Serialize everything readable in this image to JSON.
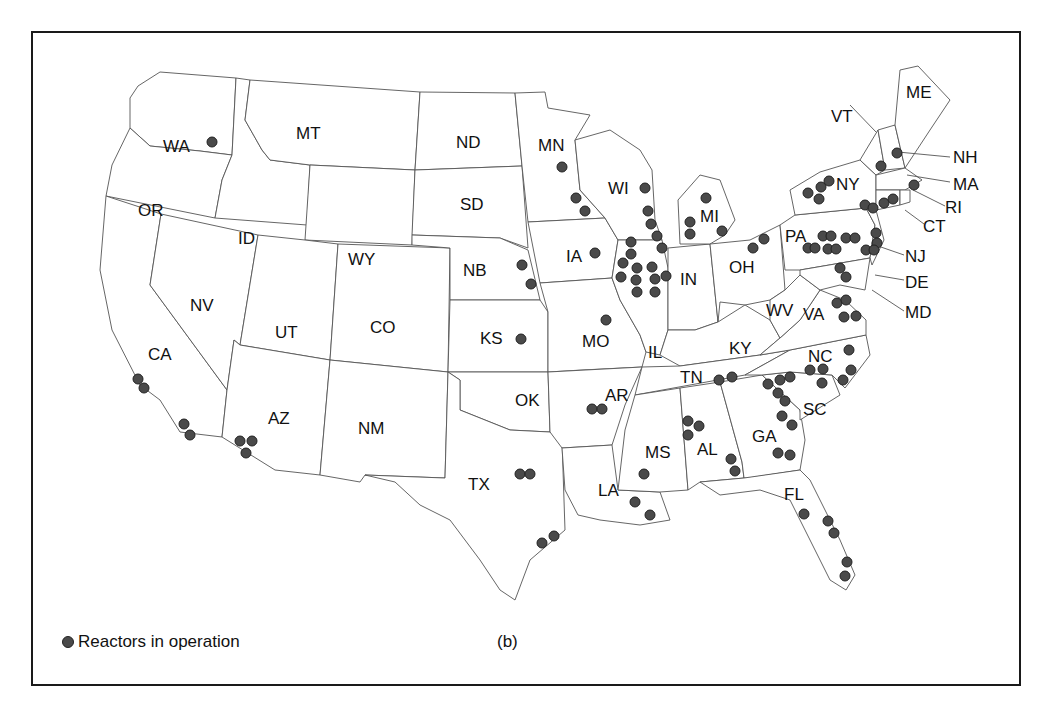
{
  "figure": {
    "caption": "(b)",
    "legend": {
      "label": "Reactors in operation",
      "marker_color": "#4a4a4a"
    },
    "frame_color": "#1a1a1a",
    "state_stroke": "#555555"
  },
  "states": [
    {
      "abbr": "WA",
      "x": 163,
      "y": 152
    },
    {
      "abbr": "OR",
      "x": 138,
      "y": 216
    },
    {
      "abbr": "MT",
      "x": 296,
      "y": 139
    },
    {
      "abbr": "ID",
      "x": 238,
      "y": 244
    },
    {
      "abbr": "WY",
      "x": 348,
      "y": 265
    },
    {
      "abbr": "ND",
      "x": 456,
      "y": 148
    },
    {
      "abbr": "SD",
      "x": 460,
      "y": 210
    },
    {
      "abbr": "NB",
      "x": 463,
      "y": 276
    },
    {
      "abbr": "MN",
      "x": 538,
      "y": 151
    },
    {
      "abbr": "WI",
      "x": 608,
      "y": 194
    },
    {
      "abbr": "MI",
      "x": 700,
      "y": 222
    },
    {
      "abbr": "IA",
      "x": 566,
      "y": 262
    },
    {
      "abbr": "IN",
      "x": 680,
      "y": 285
    },
    {
      "abbr": "OH",
      "x": 729,
      "y": 273
    },
    {
      "abbr": "PA",
      "x": 785,
      "y": 242
    },
    {
      "abbr": "NY",
      "x": 836,
      "y": 190
    },
    {
      "abbr": "VT",
      "x": 831,
      "y": 122
    },
    {
      "abbr": "ME",
      "x": 906,
      "y": 98
    },
    {
      "abbr": "NV",
      "x": 190,
      "y": 311
    },
    {
      "abbr": "UT",
      "x": 275,
      "y": 338
    },
    {
      "abbr": "CO",
      "x": 370,
      "y": 333
    },
    {
      "abbr": "KS",
      "x": 480,
      "y": 344
    },
    {
      "abbr": "MO",
      "x": 582,
      "y": 347
    },
    {
      "abbr": "IL",
      "x": 648,
      "y": 358
    },
    {
      "abbr": "KY",
      "x": 729,
      "y": 354
    },
    {
      "abbr": "WV",
      "x": 766,
      "y": 316
    },
    {
      "abbr": "VA",
      "x": 803,
      "y": 320
    },
    {
      "abbr": "CA",
      "x": 148,
      "y": 360
    },
    {
      "abbr": "AZ",
      "x": 268,
      "y": 424
    },
    {
      "abbr": "NM",
      "x": 358,
      "y": 434
    },
    {
      "abbr": "OK",
      "x": 515,
      "y": 406
    },
    {
      "abbr": "AR",
      "x": 605,
      "y": 401
    },
    {
      "abbr": "TN",
      "x": 680,
      "y": 383
    },
    {
      "abbr": "NC",
      "x": 808,
      "y": 362
    },
    {
      "abbr": "SC",
      "x": 803,
      "y": 415
    },
    {
      "abbr": "GA",
      "x": 752,
      "y": 442
    },
    {
      "abbr": "AL",
      "x": 697,
      "y": 455
    },
    {
      "abbr": "MS",
      "x": 645,
      "y": 458
    },
    {
      "abbr": "TX",
      "x": 468,
      "y": 490
    },
    {
      "abbr": "LA",
      "x": 598,
      "y": 496
    },
    {
      "abbr": "FL",
      "x": 784,
      "y": 500
    }
  ],
  "leader_labels": [
    {
      "abbr": "NH",
      "x": 953,
      "y": 163,
      "line": [
        898,
        152,
        950,
        157
      ]
    },
    {
      "abbr": "MA",
      "x": 953,
      "y": 190,
      "line": [
        907,
        175,
        950,
        182
      ]
    },
    {
      "abbr": "RI",
      "x": 945,
      "y": 213,
      "line": [
        913,
        190,
        945,
        206
      ]
    },
    {
      "abbr": "CT",
      "x": 923,
      "y": 232,
      "line": [
        905,
        210,
        924,
        224
      ]
    },
    {
      "abbr": "NJ",
      "x": 905,
      "y": 262,
      "line": [
        878,
        246,
        904,
        255
      ]
    },
    {
      "abbr": "DE",
      "x": 905,
      "y": 288,
      "line": [
        875,
        275,
        904,
        280
      ]
    },
    {
      "abbr": "MD",
      "x": 905,
      "y": 318,
      "line": [
        872,
        290,
        904,
        311
      ]
    },
    {
      "abbr": "VT",
      "x": 0,
      "y": 0,
      "line": [
        850,
        105,
        876,
        132
      ]
    }
  ],
  "chart_data": {
    "type": "scatter",
    "legend": [
      "Reactors in operation"
    ],
    "points": [
      {
        "state": "WA",
        "x": 212,
        "y": 142
      },
      {
        "state": "CA",
        "x": 138,
        "y": 379
      },
      {
        "state": "CA",
        "x": 144,
        "y": 388
      },
      {
        "state": "CA",
        "x": 184,
        "y": 424
      },
      {
        "state": "CA",
        "x": 190,
        "y": 435
      },
      {
        "state": "AZ",
        "x": 240,
        "y": 441
      },
      {
        "state": "AZ",
        "x": 252,
        "y": 441
      },
      {
        "state": "AZ",
        "x": 246,
        "y": 453
      },
      {
        "state": "NB",
        "x": 522,
        "y": 265
      },
      {
        "state": "NB",
        "x": 531,
        "y": 284
      },
      {
        "state": "KS",
        "x": 521,
        "y": 339
      },
      {
        "state": "TX",
        "x": 520,
        "y": 474
      },
      {
        "state": "TX",
        "x": 530,
        "y": 474
      },
      {
        "state": "TX",
        "x": 542,
        "y": 543
      },
      {
        "state": "TX",
        "x": 554,
        "y": 536
      },
      {
        "state": "MN",
        "x": 562,
        "y": 167
      },
      {
        "state": "MN",
        "x": 576,
        "y": 198
      },
      {
        "state": "MN",
        "x": 585,
        "y": 211
      },
      {
        "state": "IA",
        "x": 595,
        "y": 253
      },
      {
        "state": "MO",
        "x": 606,
        "y": 320
      },
      {
        "state": "AR",
        "x": 592,
        "y": 409
      },
      {
        "state": "AR",
        "x": 602,
        "y": 409
      },
      {
        "state": "WI",
        "x": 645,
        "y": 188
      },
      {
        "state": "WI",
        "x": 648,
        "y": 211
      },
      {
        "state": "WI",
        "x": 651,
        "y": 224
      },
      {
        "state": "IL",
        "x": 657,
        "y": 236
      },
      {
        "state": "IL",
        "x": 662,
        "y": 248
      },
      {
        "state": "IL",
        "x": 631,
        "y": 242
      },
      {
        "state": "IL",
        "x": 631,
        "y": 254
      },
      {
        "state": "IL",
        "x": 623,
        "y": 263
      },
      {
        "state": "IL",
        "x": 621,
        "y": 277
      },
      {
        "state": "IL",
        "x": 637,
        "y": 268
      },
      {
        "state": "IL",
        "x": 636,
        "y": 280
      },
      {
        "state": "IL",
        "x": 637,
        "y": 292
      },
      {
        "state": "IL",
        "x": 652,
        "y": 267
      },
      {
        "state": "IL",
        "x": 655,
        "y": 279
      },
      {
        "state": "IL",
        "x": 666,
        "y": 276
      },
      {
        "state": "IL",
        "x": 655,
        "y": 292
      },
      {
        "state": "MI",
        "x": 706,
        "y": 198
      },
      {
        "state": "MI",
        "x": 690,
        "y": 222
      },
      {
        "state": "MI",
        "x": 690,
        "y": 234
      },
      {
        "state": "MI",
        "x": 722,
        "y": 231
      },
      {
        "state": "OH",
        "x": 753,
        "y": 248
      },
      {
        "state": "OH",
        "x": 764,
        "y": 239
      },
      {
        "state": "LA",
        "x": 635,
        "y": 502
      },
      {
        "state": "LA",
        "x": 650,
        "y": 515
      },
      {
        "state": "MS",
        "x": 644,
        "y": 474
      },
      {
        "state": "AL",
        "x": 688,
        "y": 421
      },
      {
        "state": "AL",
        "x": 699,
        "y": 426
      },
      {
        "state": "AL",
        "x": 688,
        "y": 435
      },
      {
        "state": "AL",
        "x": 731,
        "y": 459
      },
      {
        "state": "AL",
        "x": 735,
        "y": 471
      },
      {
        "state": "TN",
        "x": 719,
        "y": 380
      },
      {
        "state": "TN",
        "x": 732,
        "y": 377
      },
      {
        "state": "GA",
        "x": 778,
        "y": 453
      },
      {
        "state": "GA",
        "x": 790,
        "y": 455
      },
      {
        "state": "GA",
        "x": 782,
        "y": 416
      },
      {
        "state": "GA",
        "x": 792,
        "y": 425
      },
      {
        "state": "SC",
        "x": 768,
        "y": 384
      },
      {
        "state": "SC",
        "x": 778,
        "y": 393
      },
      {
        "state": "SC",
        "x": 785,
        "y": 401
      },
      {
        "state": "SC",
        "x": 780,
        "y": 380
      },
      {
        "state": "SC",
        "x": 790,
        "y": 377
      },
      {
        "state": "SC",
        "x": 822,
        "y": 383
      },
      {
        "state": "NC",
        "x": 810,
        "y": 370
      },
      {
        "state": "NC",
        "x": 823,
        "y": 369
      },
      {
        "state": "NC",
        "x": 849,
        "y": 350
      },
      {
        "state": "NC",
        "x": 851,
        "y": 370
      },
      {
        "state": "NC",
        "x": 843,
        "y": 380
      },
      {
        "state": "FL",
        "x": 804,
        "y": 514
      },
      {
        "state": "FL",
        "x": 828,
        "y": 521
      },
      {
        "state": "FL",
        "x": 834,
        "y": 533
      },
      {
        "state": "FL",
        "x": 847,
        "y": 562
      },
      {
        "state": "FL",
        "x": 845,
        "y": 576
      },
      {
        "state": "VA",
        "x": 837,
        "y": 303
      },
      {
        "state": "VA",
        "x": 846,
        "y": 300
      },
      {
        "state": "VA",
        "x": 844,
        "y": 317
      },
      {
        "state": "VA",
        "x": 856,
        "y": 316
      },
      {
        "state": "PA",
        "x": 808,
        "y": 248
      },
      {
        "state": "PA",
        "x": 815,
        "y": 248
      },
      {
        "state": "PA",
        "x": 823,
        "y": 236
      },
      {
        "state": "PA",
        "x": 831,
        "y": 236
      },
      {
        "state": "PA",
        "x": 828,
        "y": 249
      },
      {
        "state": "PA",
        "x": 836,
        "y": 249
      },
      {
        "state": "PA",
        "x": 846,
        "y": 238
      },
      {
        "state": "PA",
        "x": 855,
        "y": 238
      },
      {
        "state": "MD",
        "x": 840,
        "y": 268
      },
      {
        "state": "MD",
        "x": 846,
        "y": 277
      },
      {
        "state": "NJ",
        "x": 876,
        "y": 233
      },
      {
        "state": "NJ",
        "x": 877,
        "y": 243
      },
      {
        "state": "NJ",
        "x": 866,
        "y": 250
      },
      {
        "state": "NJ",
        "x": 874,
        "y": 250
      },
      {
        "state": "NY",
        "x": 808,
        "y": 193
      },
      {
        "state": "NY",
        "x": 819,
        "y": 199
      },
      {
        "state": "NY",
        "x": 821,
        "y": 187
      },
      {
        "state": "NY",
        "x": 829,
        "y": 181
      },
      {
        "state": "NY",
        "x": 865,
        "y": 205
      },
      {
        "state": "NY",
        "x": 873,
        "y": 208
      },
      {
        "state": "CT",
        "x": 884,
        "y": 203
      },
      {
        "state": "CT",
        "x": 893,
        "y": 199
      },
      {
        "state": "VT",
        "x": 881,
        "y": 166
      },
      {
        "state": "NH",
        "x": 897,
        "y": 153
      },
      {
        "state": "MA",
        "x": 914,
        "y": 185
      }
    ]
  }
}
